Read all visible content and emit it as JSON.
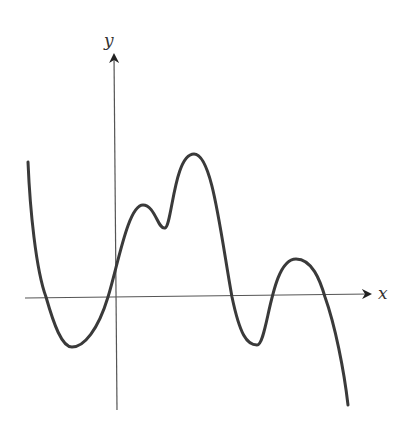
{
  "chart_data": {
    "type": "line",
    "title": "",
    "xlabel": "x",
    "ylabel": "y",
    "grid": false,
    "legend": null,
    "axes": {
      "origin_px": [
        115,
        297
      ],
      "x_axis": {
        "from_px": 25,
        "to_px": 372,
        "y_px": 297
      },
      "y_axis": {
        "from_px": 410,
        "to_px": 52,
        "x_px": 115
      }
    },
    "key_points_px": [
      {
        "label": "start",
        "x": 28,
        "y": 162
      },
      {
        "label": "x-intercept",
        "x": 46,
        "y": 297
      },
      {
        "label": "local-min",
        "x": 72,
        "y": 347
      },
      {
        "label": "x-intercept",
        "x": 108,
        "y": 297
      },
      {
        "label": "local-max",
        "x": 143,
        "y": 205
      },
      {
        "label": "local-min",
        "x": 165,
        "y": 228
      },
      {
        "label": "local-max",
        "x": 194,
        "y": 154
      },
      {
        "label": "x-intercept",
        "x": 232,
        "y": 297
      },
      {
        "label": "local-min",
        "x": 257,
        "y": 345
      },
      {
        "label": "x-intercept",
        "x": 277,
        "y": 297
      },
      {
        "label": "local-max",
        "x": 296,
        "y": 259
      },
      {
        "label": "x-intercept",
        "x": 325,
        "y": 297
      },
      {
        "label": "end",
        "x": 348,
        "y": 405
      }
    ],
    "path": "M28,162 C30,210 36,270 46,297 C54,325 62,347 72,347 C84,347 98,330 108,297 C118,265 128,205 143,205 C155,205 158,230 165,228 C172,226 174,154 194,154 C212,154 220,230 232,297 C240,335 247,345 257,345 C268,345 270,259 296,259 C312,259 320,280 325,297 C335,325 344,370 348,405",
    "colors": {
      "curve": "#3a3a3a",
      "axes": "#555555"
    }
  }
}
